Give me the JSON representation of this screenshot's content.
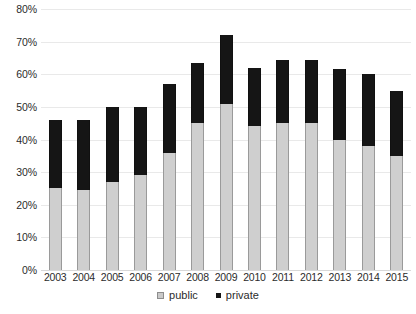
{
  "chart_data": {
    "type": "bar",
    "stacked": true,
    "title": "",
    "subtitle": "",
    "xlabel": "",
    "ylabel": "",
    "categories": [
      "2003",
      "2004",
      "2005",
      "2006",
      "2007",
      "2008",
      "2009",
      "2010",
      "2011",
      "2012",
      "2013",
      "2014",
      "2015"
    ],
    "series": [
      {
        "name": "public",
        "color": "#cfcfcf",
        "values": [
          25,
          24.5,
          27,
          29,
          36,
          45,
          51,
          44,
          45,
          45,
          40,
          38,
          35
        ]
      },
      {
        "name": "private",
        "color": "#151515",
        "values": [
          21,
          21.5,
          23,
          21,
          21,
          18.5,
          21,
          18,
          19.5,
          19.5,
          21.5,
          22,
          20
        ]
      }
    ],
    "totals": [
      46,
      46,
      50,
      50,
      57,
      63.5,
      72,
      62,
      64.5,
      64.5,
      61.5,
      60,
      55
    ],
    "ylim": [
      0,
      80
    ],
    "ytick_values": [
      0,
      10,
      20,
      30,
      40,
      50,
      60,
      70,
      80
    ],
    "ytick_labels": [
      "0%",
      "10%",
      "20%",
      "30%",
      "40%",
      "50%",
      "60%",
      "70%",
      "80%"
    ],
    "grid": true,
    "legend_position": "bottom",
    "legend": [
      {
        "label": "public",
        "color": "#cfcfcf"
      },
      {
        "label": "private",
        "color": "#151515"
      }
    ]
  }
}
